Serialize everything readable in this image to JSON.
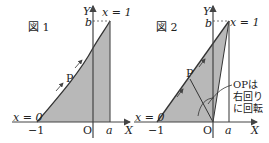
{
  "figures": [
    {
      "title": "図 1",
      "axis_x_label": "X",
      "axis_y_label": "Y",
      "origin_label": "O",
      "tick_neg1": "−1",
      "tick_a": "a",
      "tick_b": "b",
      "start_label": "x = 0",
      "end_label": "x = 1",
      "point_label": "P"
    },
    {
      "title": "図 2",
      "axis_x_label": "X",
      "axis_y_label": "Y",
      "origin_label": "O",
      "tick_neg1": "−1",
      "tick_a": "a",
      "tick_b": "b",
      "start_label": "x = 0",
      "end_label": "x = 1",
      "point_label": "P",
      "annotation": [
        "OPは",
        "右回り",
        "に回転"
      ]
    }
  ],
  "colors": {
    "fill": "#b8b8b8",
    "line": "#333333",
    "axis": "#444444"
  }
}
